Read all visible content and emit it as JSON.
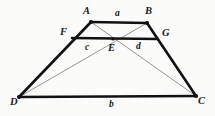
{
  "figure": {
    "type": "geometry-diagram",
    "shape": "trapezoid",
    "background_color": "#fbfbfa",
    "stroke_color_thick": "#111113",
    "stroke_color_thin": "#8a8a8c",
    "width": 215,
    "height": 116
  },
  "vertices": [
    {
      "id": "A",
      "label": "A",
      "x": 91,
      "y": 22,
      "label_x": 83,
      "label_y": 6
    },
    {
      "id": "B",
      "label": "B",
      "x": 147,
      "y": 23,
      "label_x": 145,
      "label_y": 6
    },
    {
      "id": "F",
      "label": "F",
      "x": 72,
      "y": 38,
      "label_x": 60,
      "label_y": 27
    },
    {
      "id": "G",
      "label": "G",
      "x": 158,
      "y": 39,
      "label_x": 162,
      "label_y": 28
    },
    {
      "id": "E",
      "label": "E",
      "x": 113,
      "y": 39,
      "label_x": 108,
      "label_y": 43
    },
    {
      "id": "D",
      "label": "D",
      "x": 19,
      "y": 97,
      "label_x": 10,
      "label_y": 97
    },
    {
      "id": "C",
      "label": "C",
      "x": 196,
      "y": 96,
      "label_x": 198,
      "label_y": 96
    }
  ],
  "segment_labels": [
    {
      "id": "a",
      "label": "a",
      "x": 115,
      "y": 9,
      "describes": "AB top base"
    },
    {
      "id": "b",
      "label": "b",
      "x": 109,
      "y": 100,
      "describes": "DC bottom base"
    },
    {
      "id": "c",
      "label": "c",
      "x": 85,
      "y": 43,
      "describes": "FE left half of midline"
    },
    {
      "id": "d",
      "label": "d",
      "x": 136,
      "y": 42,
      "describes": "EG right half of midline"
    }
  ],
  "edges_thick": [
    {
      "id": "AB",
      "from": "A",
      "to": "B",
      "name": "top-base"
    },
    {
      "id": "DC",
      "from": "D",
      "to": "C",
      "name": "bottom-base"
    },
    {
      "id": "DA",
      "from": "D",
      "to": "A",
      "name": "left-leg"
    },
    {
      "id": "BC",
      "from": "B",
      "to": "C",
      "name": "right-leg"
    },
    {
      "id": "FG",
      "from": "F",
      "to": "G",
      "name": "midline"
    }
  ],
  "edges_thin": [
    {
      "id": "AC",
      "from": "A",
      "to": "C",
      "name": "diagonal-ac"
    },
    {
      "id": "BD",
      "from": "B",
      "to": "D",
      "name": "diagonal-bd"
    }
  ]
}
